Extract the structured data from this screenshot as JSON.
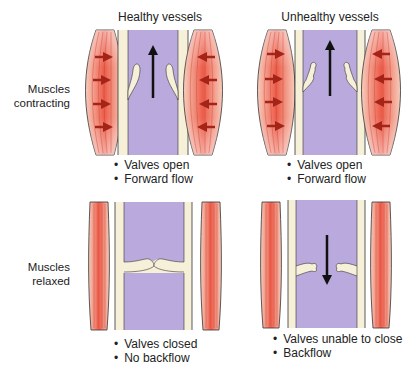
{
  "columns": [
    {
      "title": "Healthy vessels"
    },
    {
      "title": "Unhealthy vessels"
    }
  ],
  "rows": [
    {
      "label_line1": "Muscles",
      "label_line2": "contracting"
    },
    {
      "label_line1": "Muscles",
      "label_line2": "relaxed"
    }
  ],
  "panels": {
    "healthy_contracting": {
      "bullets": [
        "Valves open",
        "Forward flow"
      ]
    },
    "unhealthy_contracting": {
      "bullets": [
        "Valves open",
        "Forward flow"
      ]
    },
    "healthy_relaxed": {
      "bullets": [
        "Valves closed",
        "No backflow"
      ]
    },
    "unhealthy_relaxed": {
      "bullets": [
        "Valves unable to close",
        "Backflow"
      ]
    }
  },
  "colors": {
    "lumen": "#b9a9dc",
    "vessel_wall": "#f7f0d8",
    "muscle": "#ef6a58",
    "muscle_light": "#f6c6b4",
    "arrow_red": "#a52418",
    "outline": "#2a2a2a"
  }
}
